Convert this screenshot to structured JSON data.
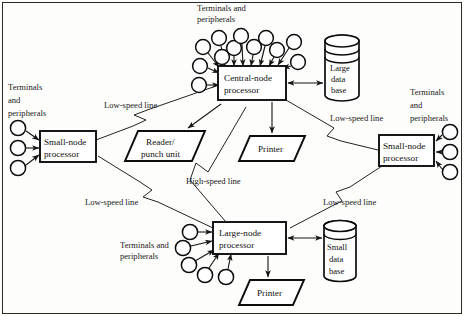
{
  "diagram": {
    "colors": {
      "background": "#fdfdfb",
      "stroke": "#0d0d0d",
      "line": "#222222",
      "text": "#101010"
    },
    "nodes": {
      "central": {
        "line1": "Central-node",
        "line2": "processor"
      },
      "small_left": {
        "line1": "Small-node",
        "line2": "processor"
      },
      "small_right": {
        "line1": "Small-node",
        "line2": "processor"
      },
      "large_bottom": {
        "line1": "Large-node",
        "line2": "processor"
      }
    },
    "devices": {
      "reader": {
        "line1": "Reader/",
        "line2": "punch unit"
      },
      "printer_top": {
        "line1": "Printer"
      },
      "printer_bottom": {
        "line1": "Printer"
      }
    },
    "databases": {
      "large": {
        "line1": "Large",
        "line2": "data",
        "line3": "base"
      },
      "small": {
        "line1": "Small",
        "line2": "data",
        "line3": "base"
      }
    },
    "peripheral_labels": {
      "top": {
        "line1": "Terminals and",
        "line2": "peripherals"
      },
      "left": {
        "line1": "Terminals",
        "line2": "and",
        "line3": "peripherals"
      },
      "right": {
        "line1": "Terminals",
        "line2": "and",
        "line3": "peripherals"
      },
      "bottom": {
        "line1": "Terminals and",
        "line2": "peripherals"
      }
    },
    "link_labels": {
      "low_speed_upper_left": "Low-speed line",
      "low_speed_upper_right": "Low-speed line",
      "low_speed_lower_left": "Low-speed line",
      "low_speed_lower_right": "Low-speed line",
      "high_speed": "High-speed line"
    },
    "terminal_counts": {
      "central_fan": 12,
      "small_left": 3,
      "small_right": 3,
      "large_bottom": 5
    }
  }
}
